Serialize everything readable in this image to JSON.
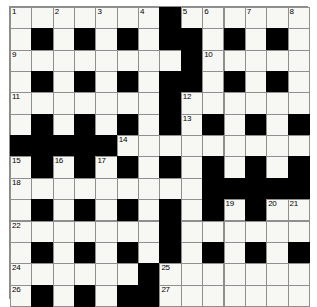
{
  "puzzle": {
    "title": "Crossword Grid",
    "columns": 14,
    "rows": 14,
    "cell_size": 21.35,
    "colors": {
      "white_cell": "#f7f7f4",
      "black_cell": "#000000",
      "grid_line": "#8f8f8f",
      "border": "#8c8c8c",
      "number_text": "#000000",
      "page_background": "#ffffff"
    },
    "clue_numbers": [
      1,
      2,
      3,
      4,
      5,
      6,
      7,
      8,
      9,
      10,
      11,
      12,
      13,
      14,
      15,
      16,
      17,
      18,
      19,
      20,
      21,
      22,
      23,
      24,
      25,
      26,
      27
    ],
    "numbered_cells": [
      {
        "n": "1",
        "row": 0,
        "col": 0
      },
      {
        "n": "2",
        "row": 0,
        "col": 2
      },
      {
        "n": "3",
        "row": 0,
        "col": 4
      },
      {
        "n": "4",
        "row": 0,
        "col": 6
      },
      {
        "n": "5",
        "row": 0,
        "col": 8
      },
      {
        "n": "6",
        "row": 0,
        "col": 9
      },
      {
        "n": "7",
        "row": 0,
        "col": 11
      },
      {
        "n": "8",
        "row": 0,
        "col": 13
      },
      {
        "n": "9",
        "row": 2,
        "col": 0
      },
      {
        "n": "10",
        "row": 2,
        "col": 9
      },
      {
        "n": "11",
        "row": 4,
        "col": 0
      },
      {
        "n": "12",
        "row": 4,
        "col": 8
      },
      {
        "n": "13",
        "row": 5,
        "col": 8
      },
      {
        "n": "14",
        "row": 6,
        "col": 5
      },
      {
        "n": "15",
        "row": 7,
        "col": 0
      },
      {
        "n": "16",
        "row": 7,
        "col": 2
      },
      {
        "n": "17",
        "row": 7,
        "col": 4
      },
      {
        "n": "18",
        "row": 8,
        "col": 0
      },
      {
        "n": "19",
        "row": 9,
        "col": 10
      },
      {
        "n": "20",
        "row": 9,
        "col": 12
      },
      {
        "n": "21",
        "row": 9,
        "col": 13
      },
      {
        "n": "22",
        "row": 10,
        "col": 0
      },
      {
        "n": "23",
        "row": 10,
        "col": 7
      },
      {
        "n": "24",
        "row": 12,
        "col": 0
      },
      {
        "n": "25",
        "row": 12,
        "col": 7
      },
      {
        "n": "26",
        "row": 13,
        "col": 0
      },
      {
        "n": "27",
        "row": 13,
        "col": 7
      }
    ],
    "layout": [
      "WWWWWWWBWWWWWW",
      "WBWBWBWBBWBWBW",
      "WWWWWWWWBWWWWW",
      "WBWBWBWBBWBWBW",
      "WWWWWWWBWWWWWW",
      "WBWBWBWBWBWBWB",
      "BBBBBWWWWWWWWW",
      "WBWBWBWBWBWBWB",
      "WWWWWWWWWBBBBB",
      "WBWBWBWBWBWBWW",
      "WWWWWWWBWWWWWW",
      "WBWBWBWBWBWBWB",
      "WWWWWWBWWWWWWW",
      "WBWBWBBWWWWWWW"
    ]
  }
}
